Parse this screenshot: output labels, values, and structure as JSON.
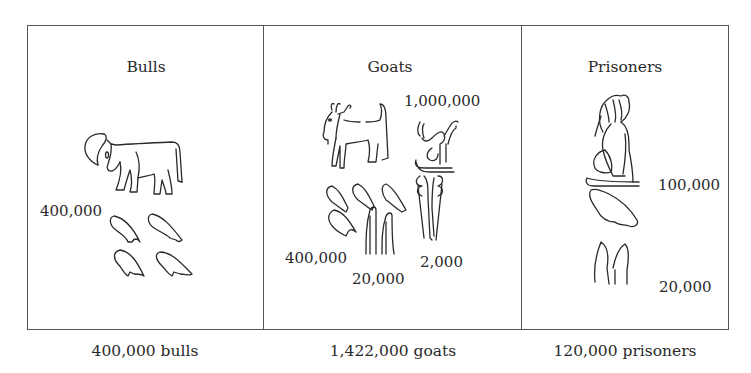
{
  "figure": {
    "panels": [
      {
        "title": "Bulls",
        "glyph": "bull-sign",
        "numerals": [
          {
            "label": "400,000",
            "sign": "4 x 100,000 signs"
          }
        ],
        "caption": "400,000 bulls"
      },
      {
        "title": "Goats",
        "glyph": "goat-sign",
        "numerals": [
          {
            "label": "1,000,000",
            "sign": "kneeling god sign"
          },
          {
            "label": "400,000",
            "sign": "4 x 100,000 signs"
          },
          {
            "label": "20,000",
            "sign": "2 x 10,000 signs"
          },
          {
            "label": "2,000",
            "sign": "2 x 1,000 signs"
          }
        ],
        "caption": "1,422,000 goats"
      },
      {
        "title": "Prisoners",
        "glyph": "bound-prisoner-sign",
        "numerals": [
          {
            "label": "100,000",
            "sign": "tadpole sign"
          },
          {
            "label": "20,000",
            "sign": "2 x 10,000 signs"
          }
        ],
        "caption": "120,000 prisoners"
      }
    ]
  }
}
